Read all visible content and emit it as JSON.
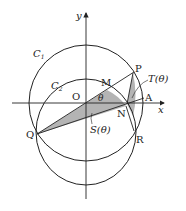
{
  "figure": {
    "axes": {
      "x_label": "x",
      "y_label": "y"
    },
    "circles": [
      {
        "name": "C1",
        "label": "C",
        "subscript": "1"
      },
      {
        "name": "C2",
        "label": "C",
        "subscript": "2"
      }
    ],
    "points": {
      "O": "O",
      "M": "M",
      "N": "N",
      "P": "P",
      "A": "A",
      "Q": "Q",
      "R": "R"
    },
    "angle_label": "θ",
    "regions": {
      "S": "S(θ)",
      "T": "T(θ)"
    },
    "colors": {
      "line": "#222222",
      "shade": "#b4b4b4"
    }
  }
}
